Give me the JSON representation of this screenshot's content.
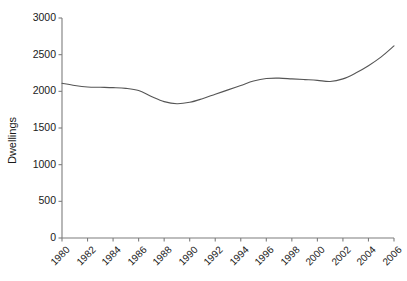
{
  "chart_data": {
    "type": "line",
    "title": "",
    "xlabel": "",
    "ylabel": "Dwellings",
    "xlim": [
      1980,
      2006
    ],
    "ylim": [
      0,
      3000
    ],
    "grid": false,
    "legend": "none",
    "y_ticks": [
      0,
      500,
      1000,
      1500,
      2000,
      2500,
      3000
    ],
    "y_tick_labels": [
      "0",
      "500",
      "1000",
      "1500",
      "2000",
      "2500",
      "3000"
    ],
    "x_ticks": [
      1980,
      1982,
      1984,
      1986,
      1988,
      1990,
      1992,
      1994,
      1996,
      1998,
      2000,
      2002,
      2004,
      2006
    ],
    "x_tick_labels": [
      "1980",
      "1982",
      "1984",
      "1986",
      "1988",
      "1990",
      "1992",
      "1994",
      "1996",
      "1998",
      "2000",
      "2002",
      "2004",
      "2006"
    ],
    "line_color": "#555555",
    "axis_color": "#7d7d7d",
    "series": [
      {
        "name": "Dwellings",
        "x": [
          1980,
          1981,
          1982,
          1983,
          1984,
          1985,
          1986,
          1987,
          1988,
          1989,
          1990,
          1991,
          1992,
          1993,
          1994,
          1995,
          1996,
          1997,
          1998,
          1999,
          2000,
          2001,
          2002,
          2003,
          2004,
          2005,
          2006
        ],
        "values": [
          2110,
          2080,
          2060,
          2055,
          2050,
          2040,
          2010,
          1930,
          1860,
          1830,
          1850,
          1900,
          1960,
          2020,
          2080,
          2140,
          2175,
          2180,
          2170,
          2160,
          2150,
          2135,
          2170,
          2250,
          2350,
          2470,
          2620
        ]
      }
    ]
  }
}
